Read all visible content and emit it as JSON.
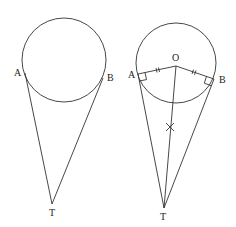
{
  "figures": [
    {
      "id": "left",
      "circle": {
        "cx": 64,
        "cy": 60,
        "r": 42
      },
      "points": {
        "A": {
          "x": 25,
          "y": 73,
          "label": "A",
          "lx": 16,
          "ly": 76
        },
        "B": {
          "x": 103,
          "y": 78,
          "label": "B",
          "lx": 107,
          "ly": 81
        },
        "T": {
          "x": 52,
          "y": 204,
          "label": "T",
          "lx": 49,
          "ly": 216
        }
      }
    },
    {
      "id": "right",
      "circle": {
        "cx": 176,
        "cy": 63,
        "r": 40
      },
      "points": {
        "O": {
          "x": 176,
          "y": 66,
          "label": "O",
          "lx": 173,
          "ly": 61
        },
        "A": {
          "x": 138,
          "y": 74,
          "label": "A",
          "lx": 129,
          "ly": 78
        },
        "B": {
          "x": 214,
          "y": 79,
          "label": "B",
          "lx": 219,
          "ly": 83
        },
        "T": {
          "x": 164,
          "y": 208,
          "label": "T",
          "lx": 161,
          "ly": 220
        }
      },
      "markers": {
        "right_angles": [
          "A",
          "B"
        ],
        "equal_ticks": [
          "OA",
          "OB"
        ],
        "cross_on_OT": {
          "x": 170,
          "y": 127
        }
      }
    }
  ]
}
